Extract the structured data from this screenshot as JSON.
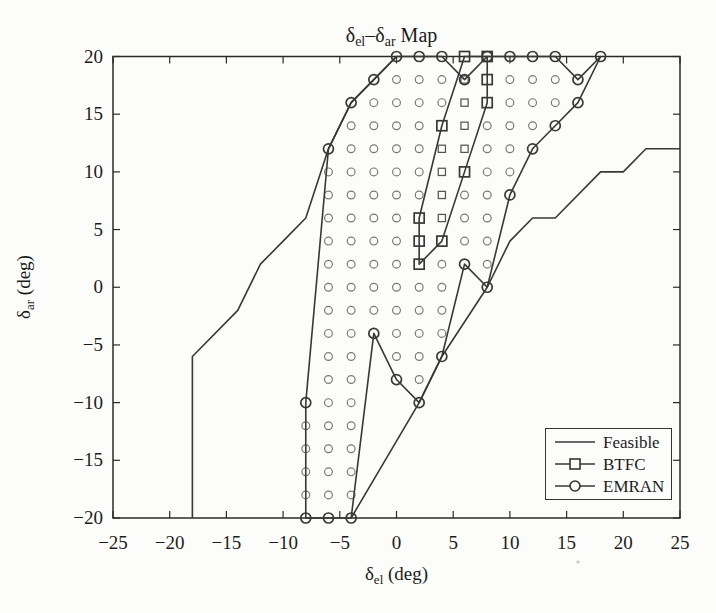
{
  "page": {
    "background": "#fcfcfa"
  },
  "chart_data": {
    "type": "line",
    "title_parts": [
      {
        "text": "δ",
        "sub": false
      },
      {
        "text": "el",
        "sub": true
      },
      {
        "text": "–",
        "sub": false
      },
      {
        "text": "δ",
        "sub": false
      },
      {
        "text": "ar",
        "sub": true
      },
      {
        "text": " Map",
        "sub": false
      }
    ],
    "xlabel_parts": [
      {
        "text": "δ",
        "sub": false
      },
      {
        "text": "el",
        "sub": true
      },
      {
        "text": " (deg)",
        "sub": false
      }
    ],
    "ylabel_parts": [
      {
        "text": "δ",
        "sub": false
      },
      {
        "text": "ar",
        "sub": true
      },
      {
        "text": " (deg)",
        "sub": false
      }
    ],
    "xlim": [
      -25,
      25
    ],
    "ylim": [
      -20,
      20
    ],
    "xticks": [
      -25,
      -20,
      -15,
      -10,
      -5,
      0,
      5,
      10,
      15,
      20,
      25
    ],
    "yticks": [
      -20,
      -15,
      -10,
      -5,
      0,
      5,
      10,
      15,
      20
    ],
    "grid": false,
    "legend_position": "bottom-right",
    "colors": {
      "axis": "#2b2b2b",
      "line": "#383838",
      "fill_circle_stroke": "#7a7a7a",
      "fill_square_stroke": "#555555",
      "text": "#1c1c1c",
      "paper": "#fcfcfa"
    },
    "legend": {
      "entries": [
        {
          "label": "Feasible",
          "marker": "none"
        },
        {
          "label": "BTFC",
          "marker": "square"
        },
        {
          "label": "EMRAN",
          "marker": "circle"
        }
      ]
    },
    "series": {
      "feasible": {
        "label": "Feasible",
        "marker": "none",
        "polylines": [
          [
            [
              -18,
              -20
            ],
            [
              -18,
              -6
            ],
            [
              -14,
              -2
            ],
            [
              -12,
              2
            ],
            [
              -10,
              4
            ],
            [
              -8,
              6
            ],
            [
              -6,
              12
            ],
            [
              -4,
              16
            ],
            [
              -2,
              18
            ],
            [
              0,
              20
            ]
          ],
          [
            [
              -4,
              -20
            ],
            [
              2,
              -10
            ],
            [
              4,
              -6
            ],
            [
              8,
              0
            ],
            [
              10,
              4
            ],
            [
              12,
              6
            ],
            [
              14,
              6
            ],
            [
              18,
              10
            ],
            [
              20,
              10
            ],
            [
              22,
              12
            ],
            [
              25,
              12
            ]
          ]
        ]
      },
      "btfc": {
        "label": "BTFC",
        "marker": "square",
        "closed": true,
        "polygon": [
          [
            6,
            20
          ],
          [
            8,
            20
          ],
          [
            8,
            18
          ],
          [
            8,
            16
          ],
          [
            6,
            10
          ],
          [
            4,
            4
          ],
          [
            2,
            2
          ],
          [
            2,
            4
          ],
          [
            2,
            6
          ],
          [
            4,
            14
          ]
        ],
        "fill_points": [
          [
            4,
            6
          ],
          [
            4,
            8
          ],
          [
            4,
            10
          ],
          [
            4,
            12
          ],
          [
            6,
            12
          ],
          [
            6,
            14
          ],
          [
            6,
            16
          ],
          [
            6,
            18
          ]
        ]
      },
      "emran": {
        "label": "EMRAN",
        "marker": "circle",
        "closed": true,
        "polygon": [
          [
            0,
            20
          ],
          [
            2,
            20
          ],
          [
            4,
            20
          ],
          [
            6,
            18
          ],
          [
            8,
            20
          ],
          [
            10,
            20
          ],
          [
            12,
            20
          ],
          [
            14,
            20
          ],
          [
            16,
            18
          ],
          [
            18,
            20
          ],
          [
            16,
            16
          ],
          [
            14,
            14
          ],
          [
            12,
            12
          ],
          [
            10,
            8
          ],
          [
            8,
            0
          ],
          [
            6,
            2
          ],
          [
            4,
            -6
          ],
          [
            2,
            -10
          ],
          [
            0,
            -8
          ],
          [
            -2,
            -4
          ],
          [
            -4,
            -20
          ],
          [
            -6,
            -20
          ],
          [
            -8,
            -20
          ],
          [
            -8,
            -10
          ],
          [
            -6,
            12
          ],
          [
            -4,
            16
          ],
          [
            -2,
            18
          ]
        ],
        "fill_points": [
          [
            -8,
            -18
          ],
          [
            -8,
            -16
          ],
          [
            -8,
            -14
          ],
          [
            -8,
            -12
          ],
          [
            -6,
            -18
          ],
          [
            -6,
            -16
          ],
          [
            -6,
            -14
          ],
          [
            -6,
            -12
          ],
          [
            -6,
            -10
          ],
          [
            -6,
            -8
          ],
          [
            -6,
            -6
          ],
          [
            -6,
            -4
          ],
          [
            -6,
            -2
          ],
          [
            -6,
            0
          ],
          [
            -6,
            2
          ],
          [
            -6,
            4
          ],
          [
            -6,
            6
          ],
          [
            -6,
            8
          ],
          [
            -6,
            10
          ],
          [
            -4,
            -18
          ],
          [
            -4,
            -16
          ],
          [
            -4,
            -14
          ],
          [
            -4,
            -12
          ],
          [
            -4,
            -10
          ],
          [
            -4,
            -8
          ],
          [
            -4,
            -6
          ],
          [
            -4,
            -4
          ],
          [
            -4,
            -2
          ],
          [
            -4,
            0
          ],
          [
            -4,
            2
          ],
          [
            -4,
            4
          ],
          [
            -4,
            6
          ],
          [
            -4,
            8
          ],
          [
            -4,
            10
          ],
          [
            -4,
            12
          ],
          [
            -4,
            14
          ],
          [
            -2,
            -2
          ],
          [
            -2,
            0
          ],
          [
            -2,
            2
          ],
          [
            -2,
            4
          ],
          [
            -2,
            6
          ],
          [
            -2,
            8
          ],
          [
            -2,
            10
          ],
          [
            -2,
            12
          ],
          [
            -2,
            14
          ],
          [
            -2,
            16
          ],
          [
            0,
            -6
          ],
          [
            0,
            -4
          ],
          [
            0,
            -2
          ],
          [
            0,
            0
          ],
          [
            0,
            2
          ],
          [
            0,
            4
          ],
          [
            0,
            6
          ],
          [
            0,
            8
          ],
          [
            0,
            10
          ],
          [
            0,
            12
          ],
          [
            0,
            14
          ],
          [
            0,
            16
          ],
          [
            0,
            18
          ],
          [
            2,
            -8
          ],
          [
            2,
            -6
          ],
          [
            2,
            -4
          ],
          [
            2,
            -2
          ],
          [
            2,
            0
          ],
          [
            2,
            8
          ],
          [
            2,
            10
          ],
          [
            2,
            12
          ],
          [
            2,
            14
          ],
          [
            2,
            16
          ],
          [
            2,
            18
          ],
          [
            4,
            -4
          ],
          [
            4,
            -2
          ],
          [
            4,
            0
          ],
          [
            4,
            2
          ],
          [
            4,
            16
          ],
          [
            4,
            18
          ],
          [
            6,
            4
          ],
          [
            6,
            6
          ],
          [
            6,
            8
          ],
          [
            8,
            2
          ],
          [
            8,
            4
          ],
          [
            8,
            6
          ],
          [
            8,
            8
          ],
          [
            8,
            10
          ],
          [
            8,
            12
          ],
          [
            8,
            14
          ],
          [
            10,
            10
          ],
          [
            10,
            12
          ],
          [
            10,
            14
          ],
          [
            10,
            16
          ],
          [
            10,
            18
          ],
          [
            12,
            14
          ],
          [
            12,
            16
          ],
          [
            12,
            18
          ],
          [
            14,
            16
          ],
          [
            14,
            18
          ]
        ]
      }
    }
  }
}
